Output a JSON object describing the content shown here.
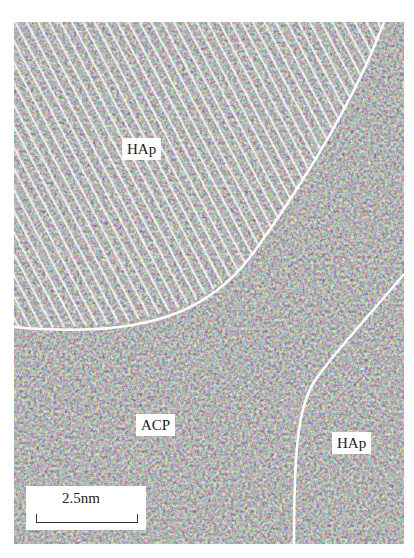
{
  "figure": {
    "type": "TEM micrograph",
    "regions": [
      {
        "label": "HAp",
        "description": "crystalline lattice fringes, upper-left"
      },
      {
        "label": "ACP",
        "description": "amorphous calcium phosphate, lower-left/center"
      },
      {
        "label": "HAp",
        "description": "crystalline region, lower-right"
      }
    ],
    "scale_bar": {
      "label": "2.5nm"
    },
    "colors": {
      "background": "#ffffff",
      "boundary": "#ffffff",
      "label_bg": "#ffffff",
      "text": "#222222"
    }
  }
}
